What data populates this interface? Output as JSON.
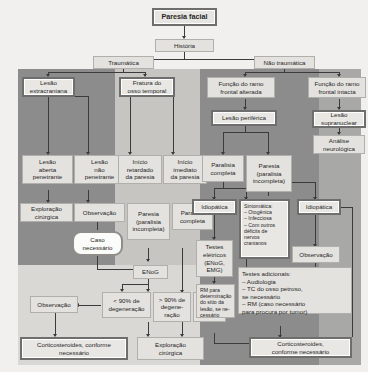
{
  "meta": {
    "title": "Paresia facial",
    "type": "clinical-decision-flowchart",
    "language": "pt-BR"
  },
  "palette": {
    "page_background": "#f2f0ee",
    "band_dark": "#8c8c8c",
    "band_mid": "#a8a8a6",
    "band_light": "#c6c5c2",
    "band_pale": "#d9d8d5",
    "node_fill": "#ebe9e6",
    "node_border": "#9a9a98",
    "node_border_strong": "#6e6e6c",
    "connector": "#3b3b3b",
    "text": "#262626"
  },
  "nodes": {
    "root": "Paresia facial",
    "historia": "História",
    "traumatica": "Traumática",
    "nao_traumatica": "Não traumática",
    "lesao_extracraniana": "Lesão\nextracraniana",
    "fratura_osso_temporal": "Fratura do\nosso temporal",
    "funcao_frontal_alterada": "Função do ramo\nfrontal alterada",
    "funcao_frontal_intacta": "Função do ramo\nfrontal intacta",
    "lesao_periferica": "Lesão periférica",
    "lesao_supranuclear": "Lesão\nsupranuclear",
    "analise_neurologica": "Análise\nneurológica",
    "lesao_aberta_penetrante": "Lesão\naberta\npenetrante",
    "lesao_nao_penetrante": "Lesão\nnão\npenetrante",
    "inicio_retardado": "Início\nretardado\nda paresia",
    "inicio_imediato": "Início\nimediato\nda paresia",
    "paralisia_completa_centro": "Paralisia\ncompleta",
    "paresia_incompleta_centro": "Paresia\n(paralisia\nincompleta)",
    "exploracao_cirurgica_1": "Exploração\ncirúrgica",
    "observacao_1": "Observação",
    "caso_necessario": "Caso\nnecessário",
    "paresia_incompleta_esq": "Paresia\n(paralisia\nincompleta)",
    "paralisia_completa_esq": "Paralisia\ncompleta",
    "enog": "ENoG",
    "menos_90": "< 90% de\ndegeneração",
    "mais_90": "> 90% de\ndegene-\nração",
    "emg_audiometria": "EMG,\naudio-\nmetria",
    "observacao_2": "Observação",
    "corticosteroides_esq": "Corticosteroides, conforme\nnecessário",
    "exploracao_cirurgica_2": "Exploração\ncirúrgica",
    "idiopatica_1": "Idiopática",
    "sintomatica": "Sintomática:\n– Otogênica\n– Infecciosa\n– Com outros\n   déficits de\n   nervos\n   cranianos",
    "idiopatica_2": "Idiopática",
    "observacao_3": "Observação",
    "testes_eletricos": "Testes\nelétricos\n(ENoG,\nEMG)",
    "rm_determinacao": "RM para\ndeterminação\ndo sítio da\nlesão, se ne-\ncessário",
    "testes_adicionais": "Testes adicionais:\n– Audiologia\n– TC do osso petroso,\n   se necessário\n– RM (caso necessário\n   para procura por tumor)",
    "corticosteroides_dir": "Corticosteroides,\nconforme necessário"
  }
}
